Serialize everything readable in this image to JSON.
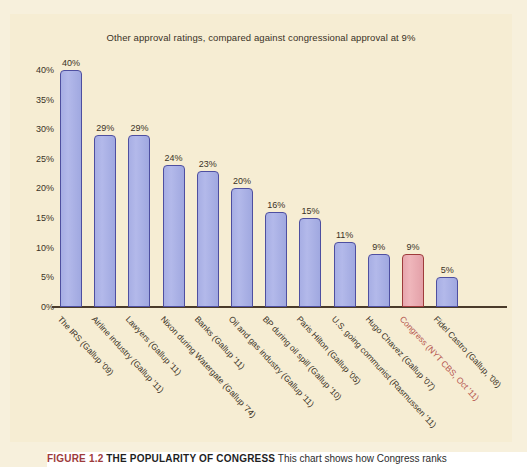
{
  "chart_data": {
    "type": "bar",
    "title": "Other approval ratings, compared against congressional approval at 9%",
    "xlabel": "",
    "ylabel": "",
    "ylim": [
      0,
      42
    ],
    "yticks": [
      "0%",
      "5%",
      "10%",
      "15%",
      "20%",
      "25%",
      "30%",
      "35%",
      "40%"
    ],
    "ytick_values": [
      0,
      5,
      10,
      15,
      20,
      25,
      30,
      35,
      40
    ],
    "grid": false,
    "legend": "none",
    "categories": [
      "The IRS (Gallup '09)",
      "Airline industry (Gallup '11)",
      "Lawyers (Gallup '11)",
      "Nixon during Watergate (Gallup '74)",
      "Banks (Gallup '11)",
      "Oil and gas industry (Gallup '11)",
      "BP during oil spill (Gallup '10)",
      "Paris Hilton (Gallup '05)",
      "U.S. going communist (Rasmussen '11)",
      "Hugo Chavez (Gallup '07)",
      "Congress (NYT CBS, Oct '11)",
      "Fidel Castro (Gallup, '08)"
    ],
    "values": [
      40,
      29,
      29,
      24,
      23,
      20,
      16,
      15,
      11,
      9,
      9,
      5
    ],
    "value_labels": [
      "40%",
      "29%",
      "29%",
      "24%",
      "23%",
      "20%",
      "16%",
      "15%",
      "11%",
      "9%",
      "9%",
      "5%"
    ],
    "highlight_index": 10,
    "colors": {
      "bar_fill": "#a7aee4",
      "bar_stroke": "#4e4fa0",
      "highlight_fill": "#e7a6ad",
      "highlight_stroke": "#9e3b3b",
      "panel_background": "#f6edd3",
      "page_background": "#f7f0dc",
      "axis": "#4a3b2a",
      "text": "#3a3226",
      "accent_label": "#b5564f"
    }
  },
  "caption": {
    "figure_number": "FIGURE 1.2",
    "headline": "THE POPULARITY OF CONGRESS",
    "body": " This chart shows how Congress ranks"
  }
}
